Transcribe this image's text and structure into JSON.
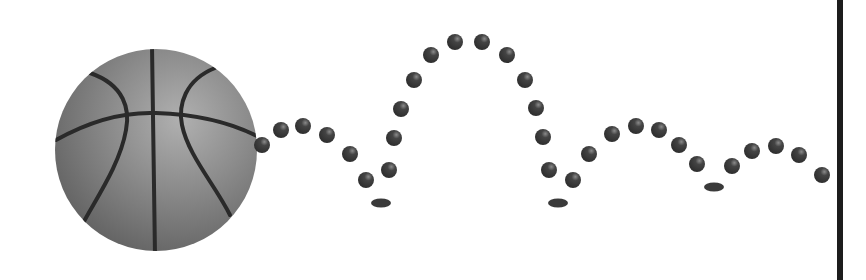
{
  "illustration": {
    "caption": "Bouncing basketball trajectory",
    "ball": {
      "cx": 156,
      "cy": 150,
      "r": 101,
      "base_color": "#8a8a8a",
      "seam_color": "#2a2a2a"
    },
    "dot_color": "#3a3a3a",
    "dot_radius": 8,
    "trajectory_dots": [
      [
        262,
        145
      ],
      [
        281,
        130
      ],
      [
        303,
        126
      ],
      [
        327,
        135
      ],
      [
        350,
        154
      ],
      [
        366,
        180
      ],
      [
        389,
        170
      ],
      [
        394,
        138
      ],
      [
        401,
        109
      ],
      [
        414,
        80
      ],
      [
        431,
        55
      ],
      [
        455,
        42
      ],
      [
        482,
        42
      ],
      [
        507,
        55
      ],
      [
        525,
        80
      ],
      [
        536,
        108
      ],
      [
        543,
        137
      ],
      [
        549,
        170
      ],
      [
        573,
        180
      ],
      [
        589,
        154
      ],
      [
        612,
        134
      ],
      [
        636,
        126
      ],
      [
        659,
        130
      ],
      [
        679,
        145
      ],
      [
        697,
        164
      ],
      [
        732,
        166
      ],
      [
        752,
        151
      ],
      [
        776,
        146
      ],
      [
        799,
        155
      ],
      [
        822,
        175
      ]
    ],
    "bounce_marks": [
      [
        381,
        203
      ],
      [
        558,
        203
      ],
      [
        714,
        187
      ]
    ],
    "divider_color": "#1c1c1c"
  }
}
